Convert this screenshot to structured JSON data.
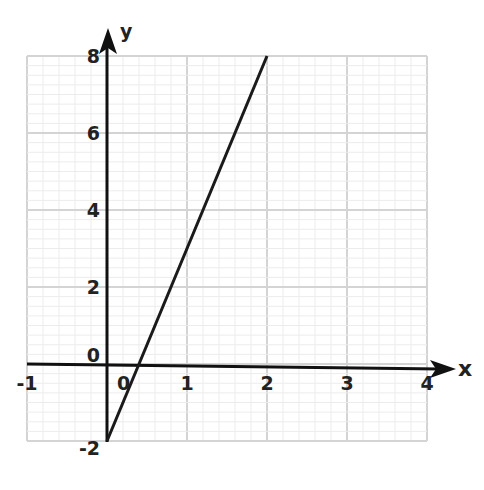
{
  "chart_data": {
    "type": "line",
    "title": "",
    "xlabel": "x",
    "ylabel": "y",
    "xlim": [
      -1,
      4
    ],
    "ylim": [
      -2,
      8
    ],
    "x_ticks": [
      "-1",
      "0",
      "1",
      "2",
      "3",
      "4"
    ],
    "y_ticks": [
      "8",
      "6",
      "4",
      "2",
      "0",
      "-2"
    ],
    "grid": true,
    "minor_grid_per_unit": {
      "x": 5,
      "y": 4
    },
    "series": [
      {
        "name": "y = 5x - 2",
        "x": [
          0,
          2
        ],
        "y": [
          -2,
          8
        ],
        "color": "#1a1a1a"
      }
    ],
    "colors": {
      "grid": "#dcdcdc",
      "axis": "#111111",
      "line": "#1a1a1a"
    }
  }
}
